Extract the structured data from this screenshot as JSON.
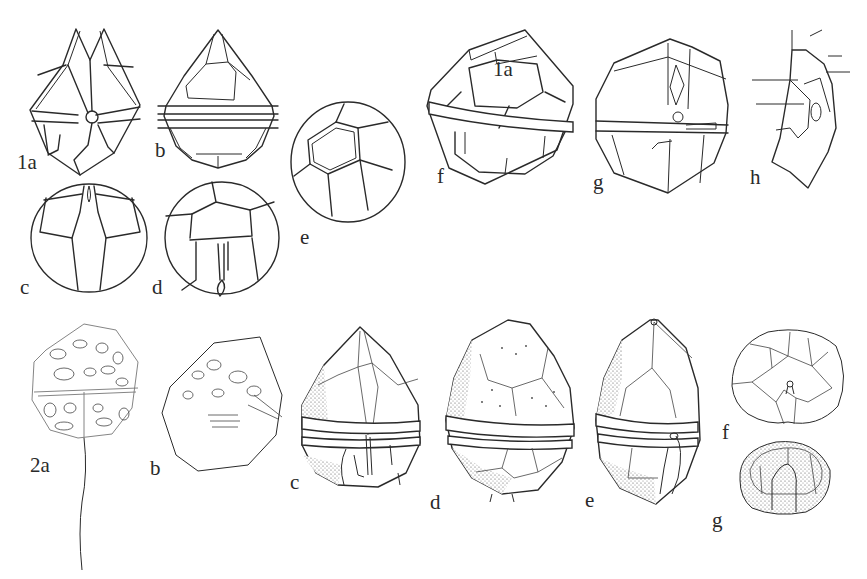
{
  "plate": {
    "background": "#ffffff",
    "ink_color": "#2a2a2a",
    "rows": [
      {
        "row_id": "1",
        "figures": [
          {
            "id": "1a",
            "label": "1a",
            "view": "ventral"
          },
          {
            "id": "1b",
            "label": "b",
            "view": "dorsal"
          },
          {
            "id": "1c",
            "label": "c",
            "view": "apical"
          },
          {
            "id": "1d",
            "label": "d",
            "view": "antapical"
          },
          {
            "id": "1e",
            "label": "e",
            "view": "oblique"
          },
          {
            "id": "1f",
            "label": "f",
            "view": "dorsal",
            "inner_label": "1a"
          },
          {
            "id": "1g",
            "label": "g",
            "view": "ventral"
          },
          {
            "id": "1h",
            "label": "h",
            "view": "sulcal detail"
          }
        ]
      },
      {
        "row_id": "2",
        "figures": [
          {
            "id": "2a",
            "label": "2a",
            "view": "ventral with flagellum"
          },
          {
            "id": "2b",
            "label": "b",
            "view": "lateral"
          },
          {
            "id": "2c",
            "label": "c",
            "view": "ventral"
          },
          {
            "id": "2d",
            "label": "d",
            "view": "dorsal"
          },
          {
            "id": "2e",
            "label": "e",
            "view": "lateral"
          },
          {
            "id": "2f",
            "label": "f",
            "view": "apical"
          },
          {
            "id": "2g",
            "label": "g",
            "view": "antapical"
          }
        ]
      }
    ]
  }
}
